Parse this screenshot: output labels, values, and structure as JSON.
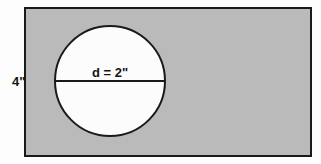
{
  "figure": {
    "background_color": "#fdfdfd"
  },
  "rectangle": {
    "name": "outer-rectangle",
    "fill_color": "#bababa",
    "stroke_color": "#1a1a1a",
    "stroke_width": 2,
    "x": 25,
    "y": 8,
    "width": 286,
    "height": 148,
    "height_label": "4\"",
    "height_label_x": 12,
    "height_label_y": 86
  },
  "circle": {
    "name": "inscribed-circle",
    "fill_color": "#fcfcfc",
    "stroke_color": "#1a1a1a",
    "stroke_width": 2,
    "center_x": 110,
    "center_y": 81,
    "radius": 55,
    "diameter_label": "d = 2\"",
    "diameter_label_x": 110,
    "diameter_label_y": 77
  },
  "diameter_line": {
    "name": "diameter-line",
    "stroke_color": "#1a1a1a",
    "stroke_width": 2,
    "x1": 55,
    "y1": 81,
    "x2": 165,
    "y2": 81
  }
}
